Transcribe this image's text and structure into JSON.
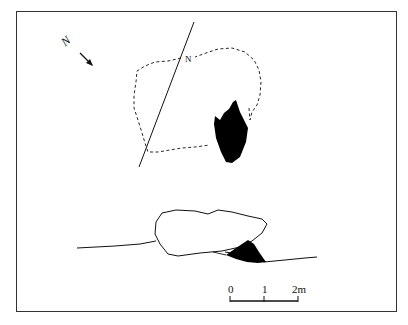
{
  "figure": {
    "type": "archaeological plan and section drawing",
    "north_arrow_label": "N",
    "baseline_label": "N",
    "scale_bar": {
      "ticks": [
        "0",
        "1",
        "2m"
      ]
    },
    "colors": {
      "ink": "#111111",
      "frame": "#333333",
      "fill": "#000000",
      "background": "#ffffff"
    }
  }
}
